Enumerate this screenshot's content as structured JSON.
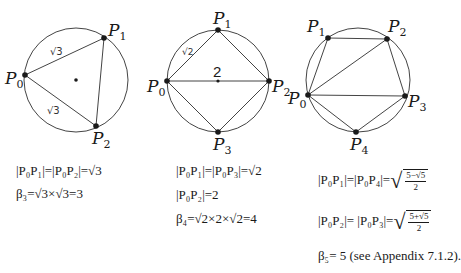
{
  "figures": [
    {
      "name": "triangle",
      "n": 3,
      "points": [
        "P0",
        "P1",
        "P2"
      ],
      "edge_labels": [
        "√3",
        "√3"
      ]
    },
    {
      "name": "square",
      "n": 4,
      "points": [
        "P0",
        "P1",
        "P2",
        "P3"
      ],
      "edge_labels": [
        "√2"
      ],
      "diagonal_label": "2"
    },
    {
      "name": "pentagon",
      "n": 5,
      "points": [
        "P0",
        "P1",
        "P2",
        "P3",
        "P4"
      ]
    }
  ],
  "labels": {
    "P": "P",
    "s0": "0",
    "s1": "1",
    "s2": "2",
    "s3": "3",
    "s4": "4",
    "sqrt3": "√3",
    "sqrt2": "√2",
    "two": "2"
  },
  "equations": {
    "tri_line1": "|P₀P₁|=|P₀P₂|=√3",
    "tri_line2": "β₃=√3×√3=3",
    "sq_line1": "|P₀P₁|=|P₀P₃|=√2",
    "sq_line2": "|P₀P₂|=2",
    "sq_line3": "β₄=√2×2×√2=4",
    "pent_line1_lhs": "|P₀P₁|=|P₀P₄|=",
    "pent_line1_num": "5−√5",
    "pent_line1_den": "2",
    "pent_line2_lhs": "|P₀P₂|=  |P₀P₃|=",
    "pent_line2_num": "5+√5",
    "pent_line2_den": "2",
    "pent_line3": "β₅= 5 (see Appendix 7.1.2)."
  }
}
